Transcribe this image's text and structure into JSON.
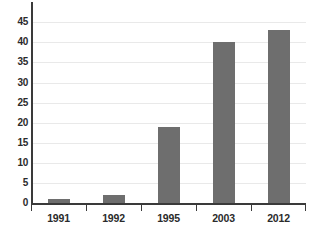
{
  "chart_data": {
    "type": "bar",
    "title": "",
    "xlabel": "",
    "ylabel": "",
    "categories": [
      "1991",
      "1992",
      "1995",
      "2003",
      "2012"
    ],
    "values": [
      1,
      2,
      19,
      40,
      43
    ],
    "ylim": [
      0,
      45
    ],
    "y_ticks": [
      0,
      5,
      10,
      15,
      20,
      25,
      30,
      35,
      40,
      45
    ],
    "y_tick_labels": [
      "0",
      "5",
      "10",
      "15",
      "20",
      "25",
      "30",
      "35",
      "40",
      "45"
    ],
    "grid": true,
    "grid_axis": "y",
    "legend": false,
    "legend_position": "none",
    "series": [
      {
        "name": "",
        "values": [
          1,
          2,
          19,
          40,
          43
        ]
      }
    ]
  },
  "style": {
    "bar_color": "#6e6e6e",
    "axis_color": "#3a3a3a",
    "grid_color": "#e9e9e9",
    "text_color": "#2b2b2b",
    "background": "#ffffff"
  },
  "caption": ""
}
